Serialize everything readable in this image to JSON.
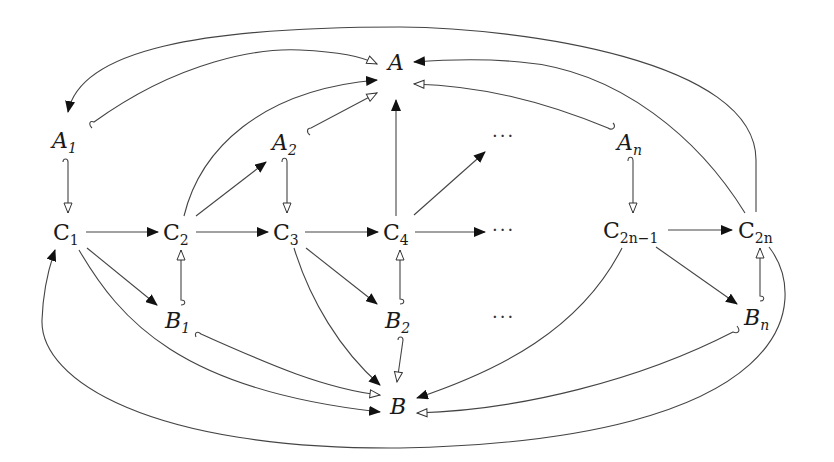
{
  "diagram": {
    "nodes": {
      "A": {
        "base": "A",
        "sub": "",
        "italic": true
      },
      "A1": {
        "base": "A",
        "sub": "1",
        "italic": true
      },
      "A2": {
        "base": "A",
        "sub": "2",
        "italic": true
      },
      "An": {
        "base": "A",
        "sub": "n",
        "italic": true
      },
      "C1": {
        "base": "C",
        "sub": "1",
        "italic": false
      },
      "C2": {
        "base": "C",
        "sub": "2",
        "italic": false
      },
      "C3": {
        "base": "C",
        "sub": "3",
        "italic": false
      },
      "C4": {
        "base": "C",
        "sub": "4",
        "italic": false
      },
      "C2n1": {
        "base": "C",
        "sub": "2n−1",
        "italic": false
      },
      "C2n": {
        "base": "C",
        "sub": "2n",
        "italic": false
      },
      "B1": {
        "base": "B",
        "sub": "1",
        "italic": true
      },
      "B2": {
        "base": "B",
        "sub": "2",
        "italic": true
      },
      "Bn": {
        "base": "B",
        "sub": "n",
        "italic": true
      },
      "B": {
        "base": "B",
        "sub": "",
        "italic": true
      }
    },
    "ellipses": {
      "upper": "···",
      "middle": "···",
      "lower": "···"
    },
    "arrowhead_styles": {
      "filled": "#111111",
      "open": "#ffffff"
    },
    "edges": [
      {
        "from": "C2n",
        "to": "A1",
        "head": "filled"
      },
      {
        "from": "A1",
        "to": "A",
        "head": "open",
        "tail": "hook"
      },
      {
        "from": "C2",
        "to": "A",
        "head": "filled"
      },
      {
        "from": "A2",
        "to": "A",
        "head": "open",
        "tail": "hook"
      },
      {
        "from": "C4",
        "to": "A",
        "head": "filled"
      },
      {
        "from": "C2n",
        "to": "A",
        "head": "filled"
      },
      {
        "from": "An",
        "to": "A",
        "head": "open",
        "tail": "hook"
      },
      {
        "from": "A1",
        "to": "C1",
        "head": "open",
        "tail": "hook"
      },
      {
        "from": "A2",
        "to": "C3",
        "head": "open",
        "tail": "hook"
      },
      {
        "from": "An",
        "to": "C2n1",
        "head": "open",
        "tail": "hook"
      },
      {
        "from": "C1",
        "to": "C2",
        "head": "filled"
      },
      {
        "from": "C2",
        "to": "C3",
        "head": "filled"
      },
      {
        "from": "C3",
        "to": "C4",
        "head": "filled"
      },
      {
        "from": "C4",
        "to": "ellipsis-middle",
        "head": "filled"
      },
      {
        "from": "C4",
        "to": "ellipsis-upper",
        "head": "filled"
      },
      {
        "from": "C2",
        "to": "A2",
        "head": "filled"
      },
      {
        "from": "C2n1",
        "to": "C2n",
        "head": "filled"
      },
      {
        "from": "B1",
        "to": "C2",
        "head": "open",
        "tail": "hook"
      },
      {
        "from": "B2",
        "to": "C4",
        "head": "open",
        "tail": "hook"
      },
      {
        "from": "Bn",
        "to": "C2n",
        "head": "open",
        "tail": "hook"
      },
      {
        "from": "C1",
        "to": "B1",
        "head": "filled"
      },
      {
        "from": "C3",
        "to": "B2",
        "head": "filled"
      },
      {
        "from": "C2n1",
        "to": "Bn",
        "head": "filled"
      },
      {
        "from": "B1",
        "to": "B",
        "head": "open",
        "tail": "hook"
      },
      {
        "from": "C1",
        "to": "B",
        "head": "filled"
      },
      {
        "from": "C3",
        "to": "B",
        "head": "filled"
      },
      {
        "from": "B2",
        "to": "B",
        "head": "open",
        "tail": "hook"
      },
      {
        "from": "C2n1",
        "to": "B",
        "head": "filled"
      },
      {
        "from": "Bn",
        "to": "B",
        "head": "open",
        "tail": "hook"
      },
      {
        "from": "C2n",
        "to": "C1",
        "head": "filled"
      }
    ]
  }
}
